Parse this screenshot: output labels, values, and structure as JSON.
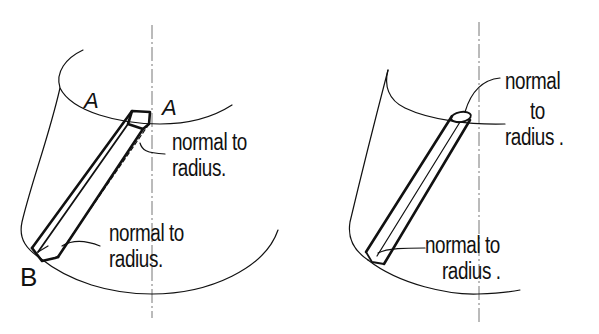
{
  "figure": {
    "type": "hand-drawn technical sketch",
    "panels": [
      {
        "id": "left",
        "description": "Square-section bar lying on a cylindrical surface from point A (top edge) to point B (bottom edge)",
        "point_labels": {
          "top_left": "A",
          "top_right": "A",
          "bottom": "B"
        },
        "annotations": [
          {
            "id": "top",
            "line1": "normal to",
            "line2": "radius."
          },
          {
            "id": "bottom",
            "line1": "normal to",
            "line2": "radius."
          }
        ]
      },
      {
        "id": "right",
        "description": "Round-section rod lying diagonally on a cylindrical surface",
        "annotations": [
          {
            "id": "top",
            "line1": "normal",
            "line2": "to",
            "line3": "radius ."
          },
          {
            "id": "bottom",
            "line1": "normal to",
            "line2": "radius ."
          }
        ]
      }
    ]
  }
}
